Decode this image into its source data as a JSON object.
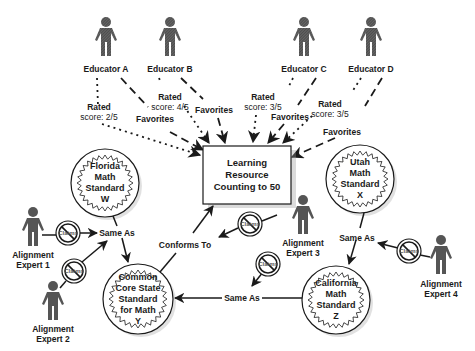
{
  "colors": {
    "ink": "#1a1a1a",
    "person": "#555555",
    "background": "#ffffff",
    "shadow": "#bbbbbb"
  },
  "educators": [
    {
      "name": "Educator A",
      "rating_label": "Rated",
      "rating_score": "score: 2/5",
      "favorite_label": "Favorites"
    },
    {
      "name": "Educator B",
      "rating_label": "Rated",
      "rating_score": "score: 4/5",
      "favorite_label": "Favorites"
    },
    {
      "name": "Educator C",
      "rating_label": "Rated",
      "rating_score": "score: 3/5",
      "favorite_label": "Favorites"
    },
    {
      "name": "Educator D",
      "rating_label": "Rated",
      "rating_score": "score: 3/5",
      "favorite_label": "Favorites"
    }
  ],
  "resource": {
    "line1": "Learning",
    "line2": "Resource",
    "line3": "Counting to 50"
  },
  "standards": [
    {
      "id": "florida",
      "lines": [
        "Florida",
        "Math",
        "Standard",
        "W"
      ]
    },
    {
      "id": "utah",
      "lines": [
        "Utah",
        "Math",
        "Standard",
        "X"
      ]
    },
    {
      "id": "common-core",
      "lines": [
        "Common",
        "Core State",
        "Standard",
        "for Math",
        "Y"
      ]
    },
    {
      "id": "california",
      "lines": [
        "California",
        "Math",
        "Standard",
        "Z"
      ]
    }
  ],
  "experts": [
    {
      "line1": "Alignment",
      "line2": "Expert 1"
    },
    {
      "line1": "Alignment",
      "line2": "Expert 2"
    },
    {
      "line1": "Alignment",
      "line2": "Expert 3"
    },
    {
      "line1": "Alignment",
      "line2": "Expert 4"
    }
  ],
  "claim_badge": {
    "label": "Claims",
    "icon": "prohibited-icon"
  },
  "relations": {
    "same_as_1": "Same As",
    "same_as_2": "Same As",
    "same_as_3": "Same As",
    "conforms_to": "Conforms To"
  }
}
